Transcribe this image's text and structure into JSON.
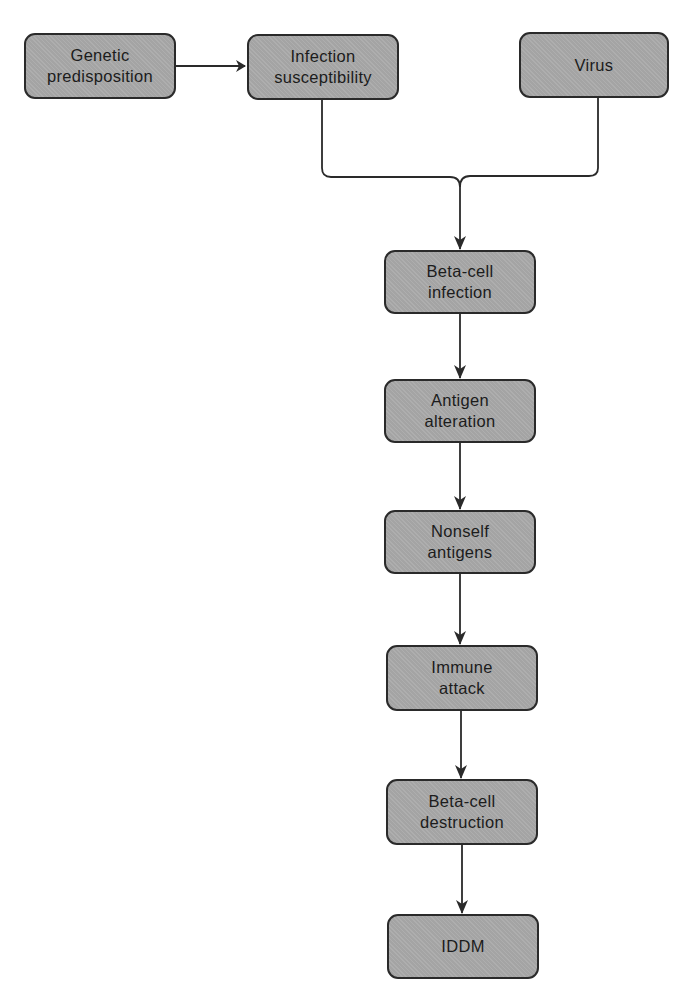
{
  "diagram": {
    "type": "flowchart",
    "nodes": [
      {
        "id": "genetic",
        "label": "Genetic\npredisposition"
      },
      {
        "id": "infection_susceptibility",
        "label": "Infection\nsusceptibility"
      },
      {
        "id": "virus",
        "label": "Virus"
      },
      {
        "id": "beta_cell_infection",
        "label": "Beta-cell\ninfection"
      },
      {
        "id": "antigen_alteration",
        "label": "Antigen\nalteration"
      },
      {
        "id": "nonself_antigens",
        "label": "Nonself\nantigens"
      },
      {
        "id": "immune_attack",
        "label": "Immune\nattack"
      },
      {
        "id": "beta_cell_destruction",
        "label": "Beta-cell\ndestruction"
      },
      {
        "id": "iddm",
        "label": "IDDM"
      }
    ],
    "edges": [
      {
        "from": "genetic",
        "to": "infection_susceptibility"
      },
      {
        "from": "infection_susceptibility",
        "to": "beta_cell_infection"
      },
      {
        "from": "virus",
        "to": "beta_cell_infection"
      },
      {
        "from": "beta_cell_infection",
        "to": "antigen_alteration"
      },
      {
        "from": "antigen_alteration",
        "to": "nonself_antigens"
      },
      {
        "from": "nonself_antigens",
        "to": "immune_attack"
      },
      {
        "from": "immune_attack",
        "to": "beta_cell_destruction"
      },
      {
        "from": "beta_cell_destruction",
        "to": "iddm"
      }
    ],
    "colors": {
      "box_fill": "#a9a9a9",
      "box_border": "#2a2a2a",
      "line": "#2a2a2a",
      "background": "#ffffff"
    }
  }
}
